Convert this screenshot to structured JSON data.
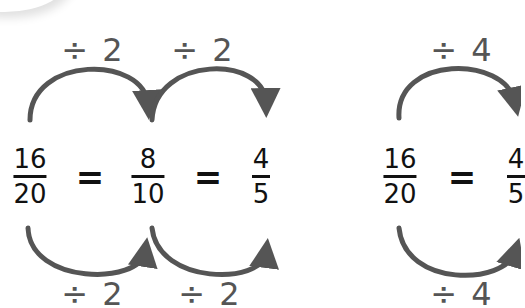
{
  "colors": {
    "arrow": "#555555",
    "text": "#111111",
    "operator_text": "#555555"
  },
  "left_diagram": {
    "top_operators": [
      "÷ 2",
      "÷ 2"
    ],
    "bottom_operators": [
      "÷ 2",
      "÷ 2"
    ],
    "fractions": [
      {
        "numerator": "16",
        "denominator": "20"
      },
      {
        "numerator": "8",
        "denominator": "10"
      },
      {
        "numerator": "4",
        "denominator": "5"
      }
    ],
    "equals": [
      "=",
      "="
    ]
  },
  "right_diagram": {
    "top_operator": "÷ 4",
    "bottom_operator": "÷ 4",
    "fractions": [
      {
        "numerator": "16",
        "denominator": "20"
      },
      {
        "numerator": "4",
        "denominator": "5"
      }
    ],
    "equals": [
      "="
    ]
  }
}
